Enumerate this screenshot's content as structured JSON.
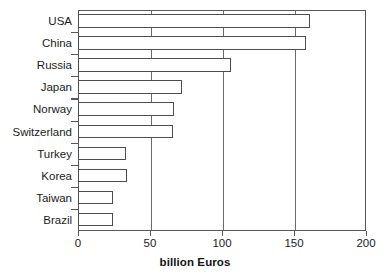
{
  "chart_data": {
    "type": "bar",
    "orientation": "horizontal",
    "title": "",
    "xlabel": "billion Euros",
    "ylabel": "",
    "xlim": [
      0,
      200
    ],
    "xticks": [
      0,
      50,
      100,
      150,
      200
    ],
    "xtick_labels": [
      "0",
      "50",
      "100",
      "150",
      "200"
    ],
    "gridlines": [
      50,
      100,
      150
    ],
    "grid": true,
    "legend": null,
    "categories": [
      "USA",
      "China",
      "Russia",
      "Japan",
      "Norway",
      "Switzerland",
      "Turkey",
      "Korea",
      "Taiwan",
      "Brazil"
    ],
    "values": [
      161,
      158,
      106,
      72,
      67,
      66,
      33,
      34,
      24,
      24
    ],
    "bar_fill_color": "#ffffff",
    "bar_edge_color": "#4d4d4f",
    "axis_color": "#58585a",
    "text_color": "#1b1b1b"
  },
  "axis": {
    "x_title": "billion Euros",
    "ticks": [
      {
        "label": "0",
        "value": 0
      },
      {
        "label": "50",
        "value": 50
      },
      {
        "label": "100",
        "value": 100
      },
      {
        "label": "150",
        "value": 150
      },
      {
        "label": "200",
        "value": 200
      }
    ]
  },
  "rows": [
    {
      "label": "USA",
      "value": 161
    },
    {
      "label": "China",
      "value": 158
    },
    {
      "label": "Russia",
      "value": 106
    },
    {
      "label": "Japan",
      "value": 72
    },
    {
      "label": "Norway",
      "value": 67
    },
    {
      "label": "Switzerland",
      "value": 66
    },
    {
      "label": "Turkey",
      "value": 33
    },
    {
      "label": "Korea",
      "value": 34
    },
    {
      "label": "Taiwan",
      "value": 24
    },
    {
      "label": "Brazil",
      "value": 24
    }
  ]
}
